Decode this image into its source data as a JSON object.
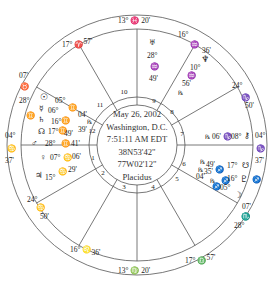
{
  "chart_info": {
    "date": "May 26, 2002",
    "place": "Washington, D.C.",
    "time": "7:51:11 AM EDT",
    "latitude": "38N53'42\"",
    "longitude": "77W02'12\"",
    "house_system": "Placidus"
  },
  "cusps": [
    {
      "house": 1,
      "label_deg": "04°",
      "sign": "♋",
      "min": "37'"
    },
    {
      "house": 2,
      "label_deg": "24°",
      "sign": "♋",
      "min": "50'"
    },
    {
      "house": 3,
      "label_deg": "16°",
      "sign": "♌",
      "min": "36'"
    },
    {
      "house": 4,
      "label_deg": "13°",
      "sign": "♍",
      "min": "20'"
    },
    {
      "house": 5,
      "label_deg": "17°",
      "sign": "♎",
      "min": "57'"
    },
    {
      "house": 6,
      "label_deg": "28°",
      "sign": "♏",
      "min": "07'"
    },
    {
      "house": 7,
      "label_deg": "04°",
      "sign": "♑",
      "min": "37'"
    },
    {
      "house": 8,
      "label_deg": "24°",
      "sign": "♑",
      "min": "50'"
    },
    {
      "house": 9,
      "label_deg": "16°",
      "sign": "♒",
      "min": "36'"
    },
    {
      "house": 10,
      "label_deg": "13°",
      "sign": "♓",
      "min": "20'"
    },
    {
      "house": 11,
      "label_deg": "17°",
      "sign": "♈",
      "min": "57'"
    },
    {
      "house": 12,
      "label_deg": "28°",
      "sign": "♉",
      "min": "07'"
    }
  ],
  "house_numbers": [
    "1",
    "2",
    "3",
    "4",
    "5",
    "6",
    "7",
    "8",
    "9",
    "10",
    "11",
    "12"
  ],
  "planets": [
    {
      "name": "Sun",
      "glyph": "☉",
      "deg": "05°",
      "sign": "♊",
      "min": "04'"
    },
    {
      "name": "Mercury",
      "glyph": "☿",
      "deg": "06°",
      "sign": "♊",
      "min": "39'",
      "retro": "℞"
    },
    {
      "name": "Saturn",
      "glyph": "♄",
      "deg": "16°",
      "sign": "♊",
      "min": "49'"
    },
    {
      "name": "North Node",
      "glyph": "☊",
      "deg": "17°",
      "sign": "♊",
      "min": "17'"
    },
    {
      "name": "Mars",
      "glyph": "♂",
      "deg": "28°",
      "sign": "♊",
      "min": "41'"
    },
    {
      "name": "Venus",
      "glyph": "♀",
      "deg": "07°",
      "sign": "♋",
      "min": "06'"
    },
    {
      "name": "Jupiter",
      "glyph": "♃",
      "deg": "15°",
      "sign": "♋",
      "min": "29'"
    },
    {
      "name": "Uranus",
      "glyph": "♅",
      "deg": "28°",
      "sign": "♒",
      "min": "49'"
    },
    {
      "name": "Neptune",
      "glyph": "♆",
      "deg": "10°",
      "sign": "♒",
      "min": "56'",
      "retro": "℞"
    },
    {
      "name": "Pluto",
      "glyph": "♇",
      "deg": "16°",
      "sign": "♐",
      "min": "35'",
      "retro": "℞"
    },
    {
      "name": "South Node",
      "glyph": "☋",
      "deg": "17°",
      "sign": "♐",
      "min": "49'",
      "retro": "℞"
    },
    {
      "name": "Moon",
      "glyph": "☽",
      "deg": "05°",
      "sign": "♐",
      "min": "04'",
      "retro": "℞"
    },
    {
      "name": "Chiron",
      "glyph": "⚷",
      "deg": "08°",
      "sign": "♑",
      "min": "06'",
      "retro": "℞"
    }
  ]
}
